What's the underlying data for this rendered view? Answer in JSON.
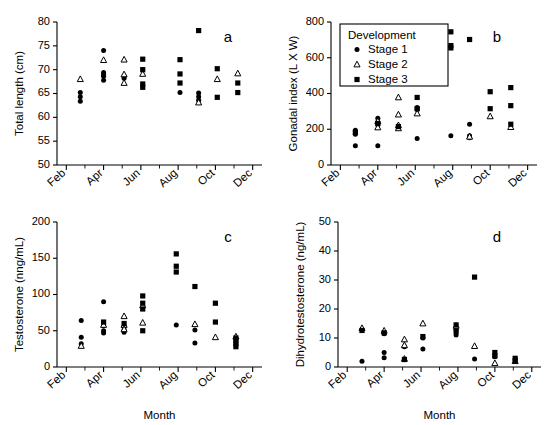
{
  "figure": {
    "panels": [
      "a",
      "b",
      "c",
      "d"
    ],
    "xlabel": "Month",
    "month_ticks": [
      "Feb",
      "Mar",
      "Apr",
      "May",
      "Jun",
      "Jul",
      "Aug",
      "Sep",
      "Oct",
      "Nov",
      "Dec"
    ],
    "month_labels_shown": [
      "Feb",
      "Apr",
      "Jun",
      "Aug",
      "Oct",
      "Dec"
    ]
  },
  "legend": {
    "title": "Development",
    "items": [
      {
        "label": "Stage 1",
        "marker": "circle"
      },
      {
        "label": "Stage 2",
        "marker": "triangle"
      },
      {
        "label": "Stage 3",
        "marker": "square"
      }
    ]
  },
  "labels": {
    "panel_a": "a",
    "panel_b": "b",
    "panel_c": "c",
    "panel_d": "d",
    "y_a": "Total length (cm)",
    "y_b": "Gonadal index (L X W)",
    "y_c": "Testosterone (nng/mL)",
    "y_d": "Dihydrotestosterone (ng/mL)",
    "x_c": "Month",
    "x_d": "Month",
    "ticks_a": [
      "50",
      "55",
      "60",
      "65",
      "70",
      "75",
      "80"
    ],
    "ticks_b": [
      "0",
      "200",
      "400",
      "600",
      "800"
    ],
    "ticks_c": [
      "0",
      "50",
      "100",
      "150",
      "200"
    ],
    "ticks_d": [
      "0",
      "10",
      "20",
      "30",
      "40",
      "50"
    ]
  },
  "chart_data": [
    {
      "type": "scatter",
      "panel": "a",
      "title": "",
      "xlabel": "",
      "ylabel": "Total length (cm)",
      "ylim": [
        50,
        80
      ],
      "yticks": [
        50,
        55,
        60,
        65,
        70,
        75,
        80
      ],
      "xlim": [
        1.5,
        12.5
      ],
      "xticks": [
        2,
        3,
        4,
        5,
        6,
        7,
        8,
        9,
        10,
        11,
        12
      ],
      "xticklabels": [
        "Feb",
        "",
        "Apr",
        "",
        "Jun",
        "",
        "Aug",
        "",
        "Oct",
        "",
        "Dec"
      ],
      "grid": false,
      "legend": false,
      "series": [
        {
          "name": "Stage 1",
          "marker": "circle",
          "points": [
            [
              2.75,
              65.2
            ],
            [
              2.75,
              64.3
            ],
            [
              2.75,
              63.4
            ],
            [
              4.0,
              74.0
            ],
            [
              4.0,
              69.4
            ],
            [
              4.0,
              68.6
            ],
            [
              4.0,
              67.8
            ],
            [
              4.0,
              69.0
            ],
            [
              5.1,
              68.6
            ],
            [
              5.1,
              68.2
            ],
            [
              8.1,
              65.2
            ],
            [
              9.1,
              65.1
            ],
            [
              9.1,
              64.3
            ],
            [
              9.1,
              63.6
            ]
          ]
        },
        {
          "name": "Stage 2",
          "marker": "triangle",
          "points": [
            [
              2.75,
              68.0
            ],
            [
              4.0,
              72.0
            ],
            [
              5.1,
              72.1
            ],
            [
              5.1,
              69.0
            ],
            [
              5.1,
              67.2
            ],
            [
              6.1,
              69.1
            ],
            [
              9.1,
              63.1
            ],
            [
              10.1,
              68.0
            ],
            [
              11.2,
              69.2
            ]
          ]
        },
        {
          "name": "Stage 3",
          "marker": "square",
          "points": [
            [
              6.1,
              72.2
            ],
            [
              6.1,
              70.0
            ],
            [
              6.1,
              67.0
            ],
            [
              6.1,
              66.3
            ],
            [
              8.1,
              72.1
            ],
            [
              8.1,
              69.1
            ],
            [
              8.1,
              67.2
            ],
            [
              9.1,
              78.2
            ],
            [
              10.1,
              70.2
            ],
            [
              10.1,
              64.2
            ],
            [
              11.2,
              67.2
            ],
            [
              11.2,
              65.2
            ]
          ]
        }
      ]
    },
    {
      "type": "scatter",
      "panel": "b",
      "title": "",
      "xlabel": "",
      "ylabel": "Gonadal index (L X W)",
      "ylim": [
        0,
        800
      ],
      "yticks": [
        0,
        200,
        400,
        600,
        800
      ],
      "xlim": [
        1.5,
        12.5
      ],
      "xticks": [
        2,
        3,
        4,
        5,
        6,
        7,
        8,
        9,
        10,
        11,
        12
      ],
      "xticklabels": [
        "Feb",
        "",
        "Apr",
        "",
        "Jun",
        "",
        "Aug",
        "",
        "Oct",
        "",
        "Dec"
      ],
      "grid": false,
      "legend": true,
      "legend_position": "upper-left",
      "series": [
        {
          "name": "Stage 1",
          "marker": "circle",
          "points": [
            [
              2.8,
              195
            ],
            [
              2.8,
              172
            ],
            [
              2.8,
              108
            ],
            [
              4.0,
              262
            ],
            [
              4.0,
              240
            ],
            [
              4.0,
              225
            ],
            [
              4.0,
              108
            ],
            [
              6.1,
              322
            ],
            [
              6.1,
              310
            ],
            [
              6.1,
              148
            ],
            [
              7.9,
              163
            ],
            [
              8.9,
              228
            ],
            [
              8.9,
              163
            ],
            [
              8.9,
              152
            ]
          ]
        },
        {
          "name": "Stage 2",
          "marker": "triangle",
          "points": [
            [
              4.0,
              245
            ],
            [
              4.0,
              210
            ],
            [
              5.1,
              378
            ],
            [
              5.1,
              282
            ],
            [
              5.1,
              222
            ],
            [
              5.1,
              205
            ],
            [
              6.1,
              288
            ],
            [
              8.9,
              158
            ],
            [
              10.0,
              272
            ],
            [
              11.1,
              212
            ]
          ]
        },
        {
          "name": "Stage 3",
          "marker": "square",
          "points": [
            [
              2.8,
              182
            ],
            [
              4.0,
              232
            ],
            [
              5.1,
              215
            ],
            [
              6.1,
              378
            ],
            [
              6.1,
              315
            ],
            [
              7.9,
              745
            ],
            [
              7.9,
              668
            ],
            [
              7.9,
              655
            ],
            [
              8.9,
              702
            ],
            [
              10.0,
              410
            ],
            [
              10.0,
              315
            ],
            [
              11.1,
              433
            ],
            [
              11.1,
              332
            ],
            [
              11.1,
              228
            ]
          ]
        }
      ]
    },
    {
      "type": "scatter",
      "panel": "c",
      "title": "",
      "xlabel": "Month",
      "ylabel": "Testosterone (nng/mL)",
      "ylim": [
        0,
        200
      ],
      "yticks": [
        0,
        50,
        100,
        150,
        200
      ],
      "xlim": [
        1.5,
        12.5
      ],
      "xticks": [
        2,
        3,
        4,
        5,
        6,
        7,
        8,
        9,
        10,
        11,
        12
      ],
      "xticklabels": [
        "Feb",
        "",
        "Apr",
        "",
        "Jun",
        "",
        "Aug",
        "",
        "Oct",
        "",
        "Dec"
      ],
      "grid": false,
      "legend": false,
      "series": [
        {
          "name": "Stage 1",
          "marker": "circle",
          "points": [
            [
              2.8,
              64
            ],
            [
              2.8,
              41
            ],
            [
              2.8,
              32
            ],
            [
              4.0,
              90
            ],
            [
              4.0,
              61
            ],
            [
              4.0,
              57
            ],
            [
              4.0,
              50
            ],
            [
              4.0,
              47
            ],
            [
              5.1,
              55
            ],
            [
              5.1,
              51
            ],
            [
              5.1,
              48
            ],
            [
              7.9,
              58
            ],
            [
              8.9,
              51
            ],
            [
              8.9,
              33
            ]
          ]
        },
        {
          "name": "Stage 2",
          "marker": "triangle",
          "points": [
            [
              2.8,
              29
            ],
            [
              4.0,
              58
            ],
            [
              5.1,
              70
            ],
            [
              5.1,
              58
            ],
            [
              5.1,
              52
            ],
            [
              6.1,
              85
            ],
            [
              6.1,
              61
            ],
            [
              8.9,
              59
            ],
            [
              10.0,
              41
            ],
            [
              11.1,
              42
            ]
          ]
        },
        {
          "name": "Stage 3",
          "marker": "square",
          "points": [
            [
              4.0,
              62
            ],
            [
              5.1,
              60
            ],
            [
              6.1,
              98
            ],
            [
              6.1,
              88
            ],
            [
              6.1,
              80
            ],
            [
              6.1,
              50
            ],
            [
              7.9,
              156
            ],
            [
              7.9,
              139
            ],
            [
              7.9,
              131
            ],
            [
              8.9,
              111
            ],
            [
              10.0,
              88
            ],
            [
              10.0,
              62
            ],
            [
              11.1,
              40
            ],
            [
              11.1,
              36
            ],
            [
              11.1,
              32
            ],
            [
              11.1,
              28
            ]
          ]
        }
      ]
    },
    {
      "type": "scatter",
      "panel": "d",
      "title": "",
      "xlabel": "Month",
      "ylabel": "Dihydrotestosterone (ng/mL)",
      "ylim": [
        0,
        50
      ],
      "yticks": [
        0,
        10,
        20,
        30,
        40,
        50
      ],
      "xlim": [
        1.5,
        12.5
      ],
      "xticks": [
        2,
        3,
        4,
        5,
        6,
        7,
        8,
        9,
        10,
        11,
        12
      ],
      "xticklabels": [
        "Feb",
        "",
        "Apr",
        "",
        "Jun",
        "",
        "Aug",
        "",
        "Oct",
        "",
        "Dec"
      ],
      "grid": false,
      "legend": false,
      "series": [
        {
          "name": "Stage 1",
          "marker": "circle",
          "points": [
            [
              2.8,
              12.8
            ],
            [
              2.8,
              2.0
            ],
            [
              4.0,
              11.5
            ],
            [
              4.0,
              5.0
            ],
            [
              4.0,
              3.2
            ],
            [
              5.1,
              7.0
            ],
            [
              5.1,
              2.5
            ],
            [
              6.1,
              10.0
            ],
            [
              6.1,
              6.2
            ],
            [
              7.9,
              13.0
            ],
            [
              7.9,
              11.0
            ],
            [
              8.9,
              2.8
            ],
            [
              10.0,
              3.5
            ]
          ]
        },
        {
          "name": "Stage 2",
          "marker": "triangle",
          "points": [
            [
              2.8,
              13.4
            ],
            [
              4.0,
              12.5
            ],
            [
              5.1,
              9.5
            ],
            [
              5.1,
              7.5
            ],
            [
              5.1,
              2.8
            ],
            [
              6.1,
              15.0
            ],
            [
              7.9,
              14.2
            ],
            [
              8.9,
              7.2
            ],
            [
              10.0,
              1.3
            ],
            [
              11.1,
              2.0
            ]
          ]
        },
        {
          "name": "Stage 3",
          "marker": "square",
          "points": [
            [
              2.8,
              12.6
            ],
            [
              4.0,
              11.8
            ],
            [
              5.1,
              2.6
            ],
            [
              6.1,
              10.5
            ],
            [
              7.9,
              14.5
            ],
            [
              7.9,
              12.3
            ],
            [
              8.9,
              31.0
            ],
            [
              10.0,
              5.0
            ],
            [
              10.0,
              3.8
            ],
            [
              11.1,
              3.0
            ],
            [
              11.1,
              2.2
            ]
          ]
        }
      ]
    }
  ]
}
